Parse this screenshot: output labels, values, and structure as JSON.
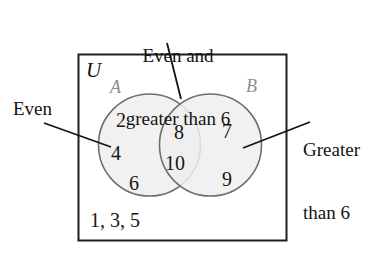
{
  "diagram": {
    "type": "venn-diagram",
    "title_label": "Even and\ngreater than 6",
    "universe_label": "U",
    "set_a_label": "A",
    "set_b_label": "B",
    "left_callout": "Even",
    "right_callout": "Greater\nthan 6",
    "top_callout_line1": "Even and",
    "top_callout_line2": "greater than 6",
    "right_callout_line1": "Greater",
    "right_callout_line2": "than 6",
    "outside_elements": "1, 3, 5",
    "regions": {
      "a_only": [
        "2",
        "4",
        "6"
      ],
      "intersection": [
        "8",
        "10"
      ],
      "b_only": [
        "7",
        "9"
      ],
      "outside": [
        "1",
        "3",
        "5"
      ]
    },
    "elements": [
      {
        "value": "2",
        "region": "a-only",
        "x": 116,
        "y": 109
      },
      {
        "value": "4",
        "region": "a-only",
        "x": 111,
        "y": 142
      },
      {
        "value": "6",
        "region": "a-only",
        "x": 129,
        "y": 172
      },
      {
        "value": "8",
        "region": "intersection",
        "x": 174,
        "y": 121
      },
      {
        "value": "10",
        "region": "intersection",
        "x": 168,
        "y": 152
      },
      {
        "value": "7",
        "region": "b-only",
        "x": 222,
        "y": 120
      },
      {
        "value": "9",
        "region": "b-only",
        "x": 222,
        "y": 168
      }
    ],
    "colors": {
      "circle_fill": "#efefef",
      "circle_stroke": "#6f6f6f",
      "box_stroke": "#1e1e1e",
      "leader_line": "#141414",
      "text": "#151515",
      "set_label_light": "#8e8e8e"
    }
  }
}
